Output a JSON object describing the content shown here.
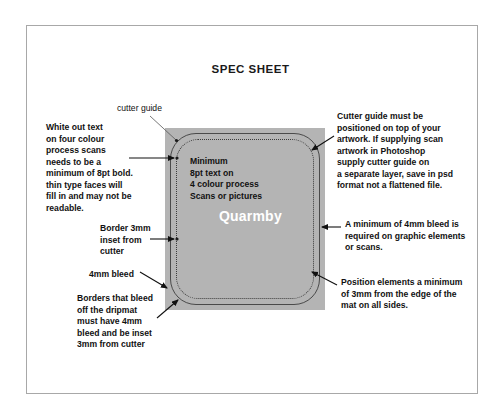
{
  "document": {
    "title": "SPEC SHEET"
  },
  "artwork": {
    "logo_text": "Quarmby",
    "inner_text": "Minimum\n8pt text on\n4 colour process\nScans or pictures",
    "fill_color": "#b4b4b4",
    "cutter_guide_color": "#4a4a4a",
    "inset_border_color": "#3a3a3a",
    "logo_color": "#ffffff"
  },
  "annotations": {
    "cutter_guide_label": "cutter guide",
    "white_out_text": "White out text\non four colour\nprocess scans\nneeds to be a\nminimum of 8pt bold.\nthin type faces will\nfill in and may not be\nreadable.",
    "border_3mm": "Border 3mm\ninset from\ncutter",
    "bleed_4mm": "4mm bleed",
    "borders_that_bleed": "Borders that bleed\noff the dripmat\nmust have 4mm\nbleed and be inset\n3mm from cutter",
    "cutter_guide_note": "Cutter guide must be\npositioned on top of your\nartwork. If supplying scan\nartwork in Photoshop\nsupply cutter guide on\na separate layer, save in psd\nformat not a flattened file.",
    "bleed_required": "A minimum of 4mm bleed is\nrequired on graphic elements\nor scans.",
    "position_elements": "Position elements a minimum\nof 3mm from the edge of the\nmat on all sides."
  },
  "page": {
    "background_color": "#ffffff",
    "frame_color": "#a8a8a8"
  }
}
